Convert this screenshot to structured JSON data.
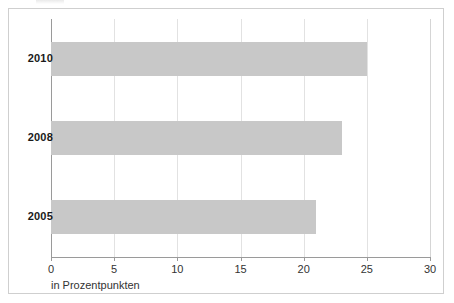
{
  "chart_data": {
    "type": "bar",
    "orientation": "horizontal",
    "title": "",
    "subtitle": "",
    "categories": [
      "2010",
      "2008",
      "2005"
    ],
    "values": [
      25,
      23,
      21
    ],
    "series": [
      {
        "name": "in Prozentpunkten",
        "values": [
          25,
          23,
          21
        ]
      }
    ],
    "xlabel": "in Prozentpunkten",
    "ylabel": "",
    "xlim": [
      0,
      30
    ],
    "xticks": [
      0,
      5,
      10,
      15,
      20,
      25,
      30
    ],
    "xtick_labels": [
      "0",
      "5",
      "10",
      "15",
      "20",
      "25",
      "30"
    ],
    "grid": true,
    "grid_axis": "x",
    "legend": false,
    "legend_position": "none",
    "annotations": [],
    "bar_color": "#c8c8c8",
    "gridline_color": "#e2e2e2",
    "axis_color": "#9a9a9a",
    "frame_color": "#cfcfcf",
    "background_color": "#ffffff"
  },
  "figure": {
    "caption": "in Prozentpunkten"
  }
}
